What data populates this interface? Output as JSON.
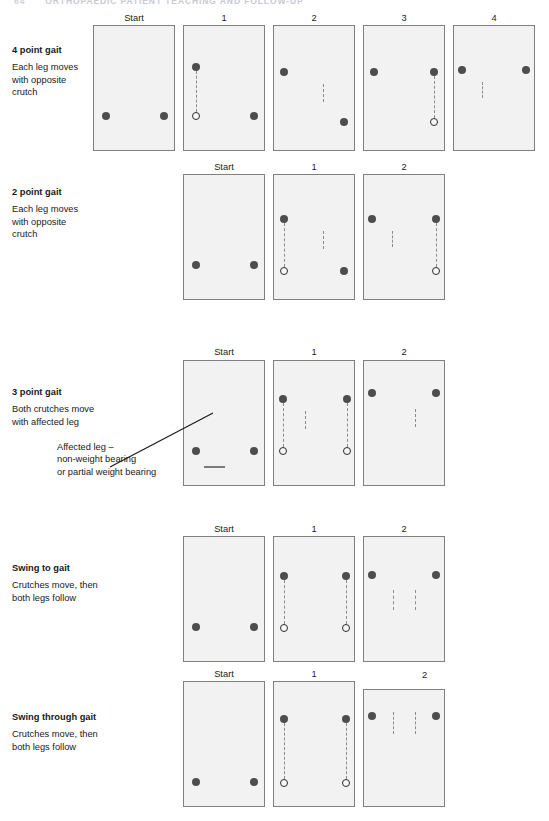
{
  "page_head": {
    "folio": "64",
    "running_title": "ORTHOPAEDIC PATIENT TEACHING AND FOLLOW-UP"
  },
  "colors": {
    "foot_weight_bearing": "#4d4d4d",
    "foot_non_weight_bearing": "#ffffff",
    "panel_fill": "#f2f2f2",
    "panel_border": "#808080",
    "connector": "#8c8c8c"
  },
  "legend": {
    "dark_foot_meaning": "weight bearing leg",
    "open_foot_meaning": "non-weight bearing or partial weight bearing leg",
    "dark_dot_meaning": "crutch tip at start of step",
    "open_dot_meaning": "crutch tip after it has moved"
  },
  "callout": {
    "line1": "Affected leg –",
    "line2": "non-weight bearing",
    "line3": "or partial weight bearing"
  },
  "sections": [
    {
      "id": "four-point-gait",
      "title": "4 point gait",
      "description_lines": [
        "Each leg moves",
        "with opposite",
        "crutch"
      ],
      "step_labels": [
        "Start",
        "1",
        "2",
        "3",
        "4"
      ],
      "steps": 5
    },
    {
      "id": "two-point-gait",
      "title": "2 point gait",
      "description_lines": [
        "Each leg moves",
        "with opposite",
        "crutch"
      ],
      "step_labels": [
        "Start",
        "1",
        "2"
      ],
      "steps": 3
    },
    {
      "id": "three-point-gait",
      "title": "3 point gait",
      "description_lines": [
        "Both crutches move",
        "with affected leg"
      ],
      "step_labels": [
        "Start",
        "1",
        "2"
      ],
      "steps": 3
    },
    {
      "id": "swing-to-gait",
      "title": "Swing to gait",
      "description_lines": [
        "Crutches move, then",
        "both legs follow"
      ],
      "step_labels": [
        "Start",
        "1",
        "2"
      ],
      "steps": 3
    },
    {
      "id": "swing-through-gait",
      "title": "Swing through gait",
      "description_lines": [
        "Crutches move, then",
        "both legs follow"
      ],
      "step_labels": [
        "Start",
        "1",
        "2"
      ],
      "steps": 3
    }
  ]
}
